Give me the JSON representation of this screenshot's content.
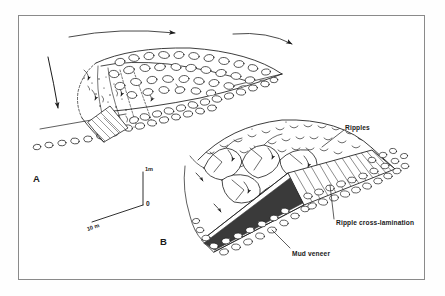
{
  "figure": {
    "background_color": "#ffffff",
    "ink_color": "#1a1a1a",
    "frame_color": "#8a8a8a"
  },
  "panels": [
    {
      "id": "A",
      "label": "A",
      "description": "Oblique view of a gravel lobe with open-framework cobbles, stippled avalanche face and flow arrows"
    },
    {
      "id": "B",
      "label": "B",
      "description": "Oblique view of a dissected bar top with angular slabs, rippled surface and a cut face showing ripple cross-lamination over a mud veneer"
    }
  ],
  "annotations": [
    {
      "name": "ripples",
      "text": "Ripples"
    },
    {
      "name": "ripple-cross-lamination",
      "text": "Ripple cross-lamination"
    },
    {
      "name": "mud-veneer",
      "text": "Mud  veneer"
    }
  ],
  "scale_bar": {
    "vertical_label": "1m",
    "origin_label": "0",
    "horizontal_label": "10 m"
  }
}
